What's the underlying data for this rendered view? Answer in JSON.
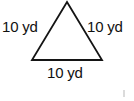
{
  "figure": {
    "shape_name": "equilateral-triangle",
    "stroke_color": "#141414",
    "fill_color": "#ffffff",
    "background_color": "#ffffff",
    "stroke_width": 1.8,
    "vertices": {
      "apex": [
        67,
        2
      ],
      "base_left": [
        32,
        60
      ],
      "base_right": [
        102,
        60
      ]
    }
  },
  "labels": {
    "left": "10 yd",
    "right": "10 yd",
    "bottom": "10 yd"
  },
  "measurements": {
    "unit": "yd",
    "unit_full": "yards",
    "side_length": 10,
    "sides": [
      {
        "position": "left",
        "value": 10,
        "unit": "yd",
        "text": "10 yd"
      },
      {
        "position": "right",
        "value": 10,
        "unit": "yd",
        "text": "10 yd"
      },
      {
        "position": "bottom",
        "value": 10,
        "unit": "yd",
        "text": "10 yd"
      }
    ]
  },
  "artifacts": {
    "corner_speck_color": "#cfcfcf"
  }
}
